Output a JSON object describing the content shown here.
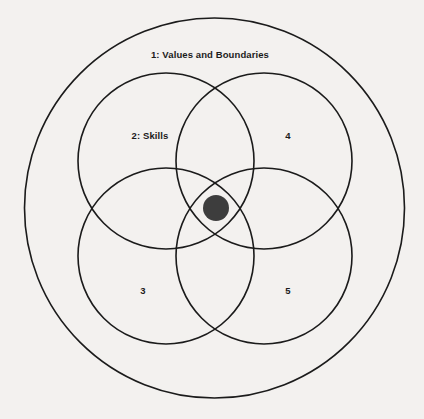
{
  "canvas": {
    "width": 424,
    "height": 419,
    "background_color": "#f3f1ef",
    "line_color": "#1b1b1b",
    "dot_color": "#3d3d3d"
  },
  "diagram": {
    "type": "venn-four-circle-with-outer-ring",
    "outer_ring": {
      "name": "outer-boundary-circle",
      "cx": 214.5,
      "cy": 208,
      "r": 190
    },
    "inner_circles": [
      {
        "id": "upper-left",
        "cx": 166,
        "cy": 161,
        "r": 88
      },
      {
        "id": "upper-right",
        "cx": 264,
        "cy": 161,
        "r": 88
      },
      {
        "id": "lower-left",
        "cx": 166,
        "cy": 256,
        "r": 88
      },
      {
        "id": "lower-right",
        "cx": 264,
        "cy": 256,
        "r": 88
      }
    ],
    "center_dot": {
      "cx": 216,
      "cy": 208,
      "r": 13
    },
    "labels": [
      {
        "id": "label-1",
        "text": "1: Values and Boundaries",
        "x": 210,
        "y": 55
      },
      {
        "id": "label-2",
        "text": "2: Skills",
        "x": 150,
        "y": 136
      },
      {
        "id": "label-4",
        "text": "4",
        "x": 288,
        "y": 136
      },
      {
        "id": "label-3",
        "text": "3",
        "x": 143,
        "y": 291
      },
      {
        "id": "label-5",
        "text": "5",
        "x": 288,
        "y": 291
      }
    ]
  }
}
